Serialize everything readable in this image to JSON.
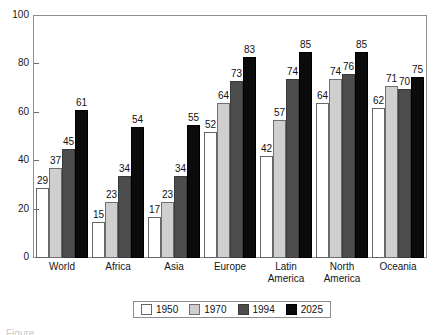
{
  "chart_data": {
    "type": "bar",
    "title": "",
    "subtitle": "",
    "xlabel": "",
    "ylabel": "",
    "ylim": [
      0,
      100
    ],
    "yticks": [
      0,
      20,
      40,
      60,
      80,
      100
    ],
    "grid": false,
    "legend_position": "bottom-center",
    "categories": [
      "World",
      "Africa",
      "Asia",
      "Europe",
      "Latin\nAmerica",
      "North\nAmerica",
      "Oceania"
    ],
    "series": [
      {
        "name": "1950",
        "color": "#ffffff",
        "values": [
          29,
          15,
          17,
          52,
          42,
          64,
          62
        ]
      },
      {
        "name": "1970",
        "color": "#cfcfcf",
        "values": [
          37,
          23,
          23,
          64,
          57,
          74,
          71
        ]
      },
      {
        "name": "1994",
        "color": "#4d4d4d",
        "values": [
          45,
          34,
          34,
          73,
          74,
          76,
          70
        ]
      },
      {
        "name": "2025",
        "color": "#0b0b0b",
        "values": [
          61,
          54,
          55,
          83,
          85,
          85,
          75
        ]
      }
    ],
    "data_labels": true,
    "annotations": []
  },
  "caption": {
    "text": "Figure"
  }
}
